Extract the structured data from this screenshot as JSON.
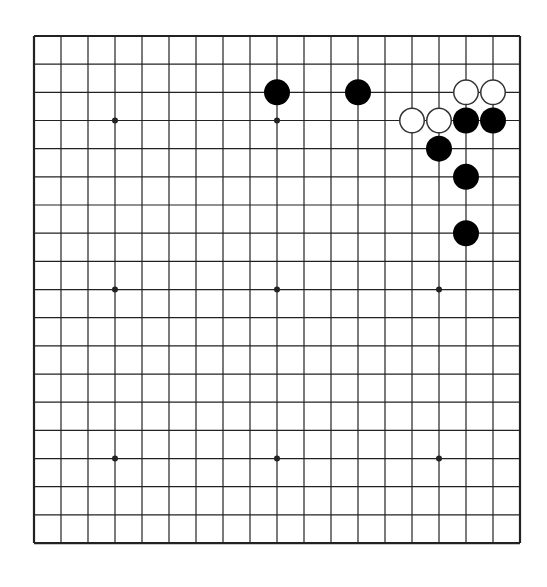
{
  "caption": "",
  "board": {
    "size": 19,
    "origin_x": 34,
    "origin_y": 36,
    "col_spacing": 27,
    "row_spacing": 28.17,
    "line_color": "#222222",
    "border_width": 2.2,
    "line_width": 1.2,
    "background": "#ffffff",
    "star_points": [
      [
        3,
        3
      ],
      [
        9,
        3
      ],
      [
        15,
        3
      ],
      [
        3,
        9
      ],
      [
        9,
        9
      ],
      [
        15,
        9
      ],
      [
        3,
        15
      ],
      [
        9,
        15
      ],
      [
        15,
        15
      ]
    ],
    "star_radius": 3
  },
  "stones": {
    "radius": 13,
    "black_color": "#000000",
    "white_fill": "#ffffff",
    "white_stroke": "#333333",
    "black": [
      [
        9,
        2
      ],
      [
        12,
        2
      ],
      [
        16,
        3
      ],
      [
        17,
        3
      ],
      [
        15,
        4
      ],
      [
        16,
        5
      ],
      [
        16,
        7
      ]
    ],
    "white": [
      [
        16,
        2
      ],
      [
        17,
        2
      ],
      [
        14,
        3
      ],
      [
        15,
        3
      ]
    ]
  }
}
